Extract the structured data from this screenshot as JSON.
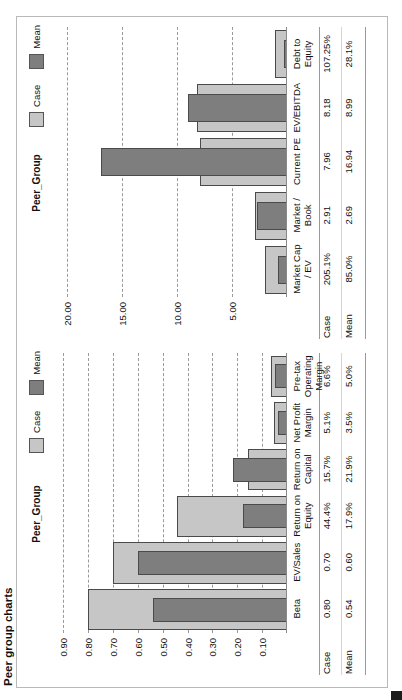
{
  "document": {
    "title": "Peer group charts",
    "corner_mark": "page-marker"
  },
  "legend": {
    "case_label": "Case",
    "mean_label": "Mean",
    "case_color": "#c6c6c6",
    "mean_color": "#7e7e7e"
  },
  "row_headers": {
    "case": "Case",
    "mean": "Mean"
  },
  "chart_data": [
    {
      "id": "chart-1",
      "type": "bar",
      "title": "Peer_Group",
      "categories": [
        "Beta",
        "EV/Sales",
        "Return on Equity",
        "Return on Capital",
        "Net Profit Margin",
        "Pre-tax Operating Margin"
      ],
      "display_values": {
        "case": [
          "0.80",
          "0.70",
          "44.4%",
          "15.7%",
          "5.1%",
          "6.6%"
        ],
        "mean": [
          "0.54",
          "0.60",
          "17.9%",
          "21.9%",
          "3.5%",
          "5.0%"
        ]
      },
      "series": [
        {
          "name": "Case",
          "values": [
            0.8,
            0.7,
            0.444,
            0.157,
            0.051,
            0.066
          ]
        },
        {
          "name": "Mean",
          "values": [
            0.54,
            0.6,
            0.179,
            0.219,
            0.035,
            0.05
          ]
        }
      ],
      "yticks": [
        "0.90",
        "0.80",
        "0.70",
        "0.60",
        "0.50",
        "0.40",
        "0.30",
        "0.20",
        "0.10"
      ],
      "ytick_values": [
        0.9,
        0.8,
        0.7,
        0.6,
        0.5,
        0.4,
        0.3,
        0.2,
        0.1
      ],
      "ylim": [
        0,
        0.95
      ],
      "xlabel": "",
      "ylabel": "",
      "grid": true,
      "legend_position": "top-right"
    },
    {
      "id": "chart-2",
      "type": "bar",
      "title": "Peer_Group",
      "categories": [
        "Market Cap / EV",
        "Market / Book",
        "Current PE",
        "EV/EBITDA",
        "Debt to Equity"
      ],
      "display_values": {
        "case": [
          "205.1%",
          "2.91",
          "7.96",
          "8.18",
          "107.25%"
        ],
        "mean": [
          "85.0%",
          "2.69",
          "16.94",
          "8.99",
          "28.1%"
        ]
      },
      "series": [
        {
          "name": "Case",
          "values": [
            2.051,
            2.91,
            7.96,
            8.18,
            1.0725
          ]
        },
        {
          "name": "Mean",
          "values": [
            0.85,
            2.69,
            16.94,
            8.99,
            0.281
          ]
        }
      ],
      "yticks": [
        "20.00",
        "15.00",
        "10.00",
        "5.00"
      ],
      "ytick_values": [
        20.0,
        15.0,
        10.0,
        5.0
      ],
      "ylim": [
        0,
        21.5
      ],
      "xlabel": "",
      "ylabel": "",
      "grid": true,
      "legend_position": "top-right"
    }
  ]
}
